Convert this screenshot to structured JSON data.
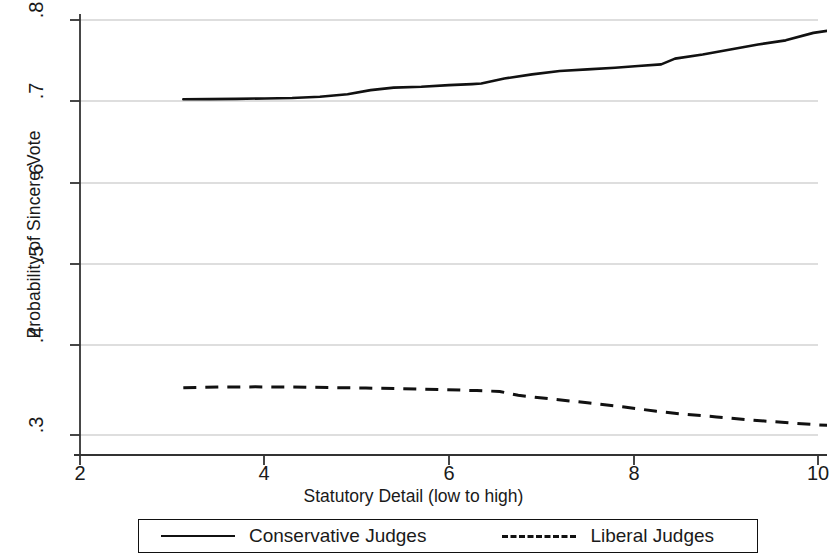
{
  "chart_data": {
    "type": "line",
    "title": "",
    "xlabel": "Statutory Detail (low to high)",
    "ylabel": "Probability of Sincere Vote",
    "xlim": [
      1.25,
      10.7
    ],
    "ylim": [
      0.2755,
      0.8
    ],
    "xticks": [
      2,
      4,
      6,
      8,
      10
    ],
    "xtick_labels": [
      "2",
      "4",
      "6",
      "8",
      "10"
    ],
    "yticks": [
      0.3,
      0.4,
      0.5,
      0.6,
      0.7,
      0.8
    ],
    "ytick_labels": [
      ".3",
      ".4",
      ".5",
      ".6",
      ".7",
      ".8"
    ],
    "grid": "horizontal",
    "legend_position": "below-center",
    "series": [
      {
        "name": "Conservative Judges",
        "style": "solid",
        "color": "#111111",
        "x": [
          3.12,
          3.4,
          3.7,
          4.0,
          4.3,
          4.6,
          4.9,
          5.15,
          5.4,
          5.7,
          6.0,
          6.25,
          6.35,
          6.6,
          6.9,
          7.2,
          7.5,
          7.8,
          8.05,
          8.3,
          8.45,
          8.75,
          9.05,
          9.35,
          9.65,
          9.95,
          10.2
        ],
        "y": [
          0.7045,
          0.7047,
          0.705,
          0.7055,
          0.706,
          0.7075,
          0.7105,
          0.7155,
          0.7185,
          0.7195,
          0.7215,
          0.7228,
          0.7235,
          0.7295,
          0.7345,
          0.7385,
          0.7405,
          0.7425,
          0.7445,
          0.7465,
          0.7535,
          0.7585,
          0.7645,
          0.7705,
          0.7755,
          0.7845,
          0.7885
        ]
      },
      {
        "name": "Liberal Judges",
        "style": "dashed",
        "color": "#111111",
        "x": [
          3.12,
          3.5,
          3.9,
          4.3,
          4.7,
          5.1,
          5.5,
          5.9,
          6.3,
          6.55,
          6.75,
          7.1,
          7.5,
          7.9,
          8.25,
          8.5,
          8.9,
          9.3,
          9.7,
          10.0,
          10.2
        ],
        "y": [
          0.3568,
          0.3578,
          0.358,
          0.3578,
          0.3572,
          0.3566,
          0.3558,
          0.3548,
          0.3535,
          0.3525,
          0.3478,
          0.3435,
          0.3388,
          0.3338,
          0.3285,
          0.3255,
          0.3218,
          0.3178,
          0.3145,
          0.3122,
          0.3112
        ]
      }
    ]
  },
  "legend": {
    "entries": [
      {
        "label": "Conservative Judges",
        "style": "solid"
      },
      {
        "label": "Liberal Judges",
        "style": "dashed"
      }
    ]
  }
}
